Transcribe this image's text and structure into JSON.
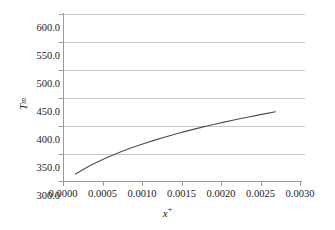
{
  "chart_data": {
    "type": "line",
    "title": "",
    "xlabel": "x+",
    "xlabel_base": "x",
    "xlabel_sup": "+",
    "ylabel": "Tm",
    "ylabel_base": "T",
    "ylabel_sub": "m",
    "xlim": [
      0.0,
      0.003
    ],
    "ylim": [
      300.0,
      600.0
    ],
    "xticks": [
      "0.0000",
      "0.0005",
      "0.0010",
      "0.0015",
      "0.0020",
      "0.0025",
      "0.0030"
    ],
    "xtick_values": [
      0.0,
      0.0005,
      0.001,
      0.0015,
      0.002,
      0.0025,
      0.003
    ],
    "yticks": [
      "300.0",
      "350.0",
      "400.0",
      "450.0",
      "500.0",
      "550.0",
      "600.0"
    ],
    "ytick_values": [
      300,
      350,
      400,
      450,
      500,
      550,
      600
    ],
    "grid": "horizontal",
    "legend": "none",
    "line_color": "#4d4d4d",
    "grid_color": "#c9c9c9",
    "axis_color": "#9a9a9a",
    "background": "#ffffff",
    "series": [
      {
        "name": "Tm",
        "x": [
          0.00016,
          0.00025,
          0.00035,
          0.00045,
          0.00055,
          0.00065,
          0.00075,
          0.00085,
          0.00095,
          0.00105,
          0.00115,
          0.00125,
          0.00135,
          0.00145,
          0.00155,
          0.00165,
          0.00175,
          0.00185,
          0.00195,
          0.00205,
          0.00215,
          0.00225,
          0.00235,
          0.00245,
          0.00255,
          0.00269
        ],
        "y": [
          314.3,
          322.0,
          329.8,
          336.8,
          343.2,
          349.2,
          354.8,
          360.1,
          365.1,
          369.8,
          374.3,
          378.6,
          382.7,
          386.6,
          390.4,
          394.0,
          397.5,
          400.9,
          404.1,
          407.3,
          410.3,
          413.3,
          416.2,
          419.0,
          421.7,
          425.4
        ]
      }
    ]
  }
}
